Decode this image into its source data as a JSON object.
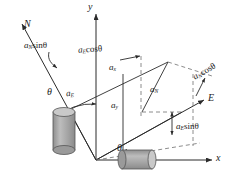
{
  "diagram": {
    "axes": {
      "y_label": "y",
      "x_label": "x",
      "n_label": "N",
      "e_label": "E"
    },
    "angles": {
      "theta_upper": "θ",
      "theta_lower": "θ"
    },
    "components": {
      "a_x": "a",
      "a_x_sub": "x",
      "a_y": "a",
      "a_y_sub": "y",
      "a_E": "a",
      "a_E_sub": "E",
      "a_N": "a",
      "a_N_sub": "N"
    },
    "projections": {
      "aN_sin": {
        "base": "a",
        "sub": "N",
        "trig": "sinθ"
      },
      "aE_cos": {
        "base": "a",
        "sub": "E",
        "trig": "cosθ"
      },
      "aN_cos": {
        "base": "a",
        "sub": "N",
        "trig": "cosθ"
      },
      "aE_sin": {
        "base": "a",
        "sub": "E",
        "trig": "sinθ"
      }
    },
    "colors": {
      "line": "#2b2b2b",
      "dashed": "#6e6e6e",
      "cylinder_body": "#a8a8a8",
      "cylinder_top": "#c9c9c9",
      "cylinder_edge": "#555555",
      "text": "#1a1a1a"
    }
  }
}
